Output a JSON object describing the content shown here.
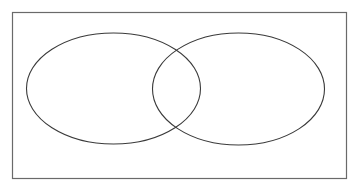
{
  "diagram": {
    "type": "venn",
    "sets": [
      {
        "name": "left-set",
        "label": ""
      },
      {
        "name": "right-set",
        "label": ""
      }
    ],
    "colors": {
      "stroke": "#3a3a3a",
      "frame": "#6a6a6a",
      "background": "#ffffff"
    }
  }
}
